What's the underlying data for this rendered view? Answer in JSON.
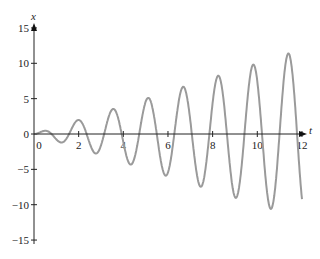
{
  "chart_data": {
    "type": "line",
    "title": "",
    "xlabel": "t",
    "ylabel": "x",
    "xlim": [
      0,
      12
    ],
    "ylim": [
      -15,
      15
    ],
    "x_ticks": [
      0,
      2,
      4,
      6,
      8,
      10,
      12
    ],
    "y_ticks": [
      -15,
      -10,
      -5,
      0,
      5,
      10,
      15
    ],
    "x_tick_labels": [
      "0",
      "2",
      "4",
      "6",
      "8",
      "10",
      "12"
    ],
    "y_tick_labels": [
      "−15",
      "−10",
      "−5",
      "0",
      "5",
      "10",
      "15"
    ],
    "grid": false,
    "legend": null,
    "series": [
      {
        "name": "x(t) = t·sin(4t)",
        "color": "#9a9a9a",
        "points": [
          [
            0,
            0
          ],
          [
            0.39,
            0.39
          ],
          [
            0.79,
            0
          ],
          [
            1.18,
            -1.18
          ],
          [
            1.57,
            0
          ],
          [
            1.96,
            1.96
          ],
          [
            2.36,
            0
          ],
          [
            2.75,
            -2.75
          ],
          [
            3.14,
            0
          ],
          [
            3.53,
            3.53
          ],
          [
            3.93,
            0
          ],
          [
            4.32,
            -4.32
          ],
          [
            4.71,
            0
          ],
          [
            5.11,
            5.11
          ],
          [
            5.5,
            0
          ],
          [
            5.89,
            -5.89
          ],
          [
            6.28,
            0
          ],
          [
            6.68,
            6.68
          ],
          [
            7.07,
            0
          ],
          [
            7.46,
            -7.46
          ],
          [
            7.85,
            0
          ],
          [
            8.25,
            8.25
          ],
          [
            8.64,
            0
          ],
          [
            9.03,
            -9.03
          ],
          [
            9.42,
            0
          ],
          [
            9.82,
            9.82
          ],
          [
            10.21,
            0
          ],
          [
            10.6,
            -10.6
          ],
          [
            11.0,
            0
          ],
          [
            11.39,
            11.39
          ],
          [
            11.78,
            0
          ],
          [
            12,
            -9.2
          ]
        ]
      }
    ]
  },
  "axes": {
    "x_label": "t",
    "y_label": "x"
  }
}
